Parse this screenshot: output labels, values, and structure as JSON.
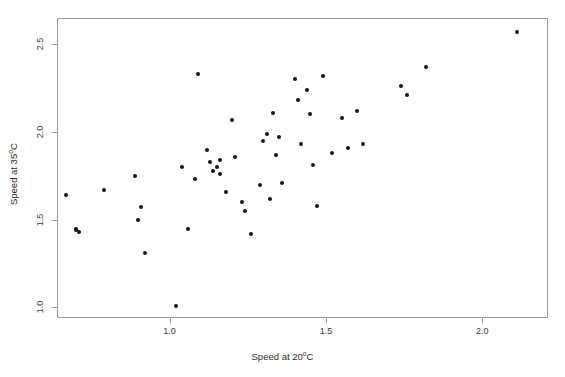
{
  "chart_data": {
    "type": "scatter",
    "title": "",
    "xlabel": "Speed at 20°C",
    "ylabel": "Speed at 35°C",
    "xlim": [
      0.64,
      2.21
    ],
    "ylim": [
      0.94,
      2.65
    ],
    "xticks": [
      1.0,
      1.5,
      2.0
    ],
    "xticklabels": [
      "1.0",
      "1.5",
      "2.0"
    ],
    "yticks": [
      1.0,
      1.5,
      2.0,
      2.5
    ],
    "yticklabels": [
      "1.0",
      "1.5",
      "2.0",
      "2.5"
    ],
    "grid": false,
    "legend": null,
    "marker": "filled-circle",
    "marker_color": "#141414",
    "points": [
      {
        "x": 0.67,
        "y": 1.64
      },
      {
        "x": 0.7,
        "y": 1.45
      },
      {
        "x": 0.7,
        "y": 1.44
      },
      {
        "x": 0.71,
        "y": 1.43
      },
      {
        "x": 0.79,
        "y": 1.67
      },
      {
        "x": 0.89,
        "y": 1.75
      },
      {
        "x": 0.9,
        "y": 1.5
      },
      {
        "x": 0.91,
        "y": 1.57
      },
      {
        "x": 0.92,
        "y": 1.31
      },
      {
        "x": 1.02,
        "y": 1.01
      },
      {
        "x": 1.04,
        "y": 1.8
      },
      {
        "x": 1.06,
        "y": 1.45
      },
      {
        "x": 1.08,
        "y": 1.73
      },
      {
        "x": 1.09,
        "y": 2.33
      },
      {
        "x": 1.12,
        "y": 1.9
      },
      {
        "x": 1.13,
        "y": 1.83
      },
      {
        "x": 1.14,
        "y": 1.78
      },
      {
        "x": 1.15,
        "y": 1.8
      },
      {
        "x": 1.16,
        "y": 1.84
      },
      {
        "x": 1.16,
        "y": 1.76
      },
      {
        "x": 1.18,
        "y": 1.66
      },
      {
        "x": 1.2,
        "y": 2.07
      },
      {
        "x": 1.21,
        "y": 1.86
      },
      {
        "x": 1.23,
        "y": 1.6
      },
      {
        "x": 1.24,
        "y": 1.55
      },
      {
        "x": 1.26,
        "y": 1.42
      },
      {
        "x": 1.29,
        "y": 1.7
      },
      {
        "x": 1.3,
        "y": 1.95
      },
      {
        "x": 1.31,
        "y": 1.99
      },
      {
        "x": 1.32,
        "y": 1.62
      },
      {
        "x": 1.33,
        "y": 2.11
      },
      {
        "x": 1.34,
        "y": 1.87
      },
      {
        "x": 1.35,
        "y": 1.97
      },
      {
        "x": 1.36,
        "y": 1.71
      },
      {
        "x": 1.4,
        "y": 2.3
      },
      {
        "x": 1.41,
        "y": 2.18
      },
      {
        "x": 1.42,
        "y": 1.93
      },
      {
        "x": 1.44,
        "y": 2.24
      },
      {
        "x": 1.45,
        "y": 2.1
      },
      {
        "x": 1.46,
        "y": 1.81
      },
      {
        "x": 1.47,
        "y": 1.58
      },
      {
        "x": 1.49,
        "y": 2.32
      },
      {
        "x": 1.52,
        "y": 1.88
      },
      {
        "x": 1.55,
        "y": 2.08
      },
      {
        "x": 1.57,
        "y": 1.91
      },
      {
        "x": 1.6,
        "y": 2.12
      },
      {
        "x": 1.62,
        "y": 1.93
      },
      {
        "x": 1.74,
        "y": 2.26
      },
      {
        "x": 1.76,
        "y": 2.21
      },
      {
        "x": 1.82,
        "y": 2.37
      },
      {
        "x": 2.11,
        "y": 2.57
      }
    ]
  }
}
